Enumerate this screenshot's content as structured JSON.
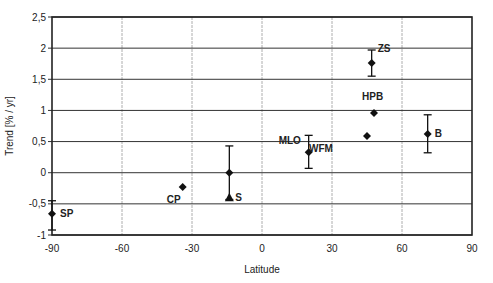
{
  "chart_data": {
    "type": "scatter",
    "title": "",
    "xlabel": "Latitude",
    "ylabel": "Trend [% / yr]",
    "xlim": [
      -90,
      90
    ],
    "ylim": [
      -1,
      2.5
    ],
    "x_ticks": [
      "-90",
      "-60",
      "-30",
      "0",
      "30",
      "60",
      "90"
    ],
    "y_ticks": [
      "-1",
      "-0,5",
      "0",
      "0,5",
      "1",
      "1,5",
      "2",
      "2,5"
    ],
    "grid": true,
    "legend": null,
    "series": [
      {
        "name": "stations",
        "marker": "diamond",
        "points": [
          {
            "label": "SP",
            "x": -90,
            "y": -0.66,
            "err_low": -0.92,
            "err_high": -0.45
          },
          {
            "label": "CP",
            "x": -34,
            "y": -0.23,
            "err_low": null,
            "err_high": null
          },
          {
            "label": "",
            "x": -14,
            "y": 0.0,
            "err_low": -0.43,
            "err_high": 0.43
          },
          {
            "label": "MLO",
            "x": 20,
            "y": 0.33,
            "err_low": 0.07,
            "err_high": 0.6
          },
          {
            "label": "WFM",
            "x": 45,
            "y": 0.59,
            "err_low": null,
            "err_high": null
          },
          {
            "label": "ZS",
            "x": 47,
            "y": 1.76,
            "err_low": 1.55,
            "err_high": 1.97
          },
          {
            "label": "HPB",
            "x": 48,
            "y": 0.96,
            "err_low": null,
            "err_high": null
          },
          {
            "label": "B",
            "x": 71,
            "y": 0.62,
            "err_low": 0.32,
            "err_high": 0.93
          }
        ]
      },
      {
        "name": "S",
        "marker": "triangle",
        "points": [
          {
            "label": "S",
            "x": -14,
            "y": -0.4
          }
        ]
      }
    ]
  }
}
